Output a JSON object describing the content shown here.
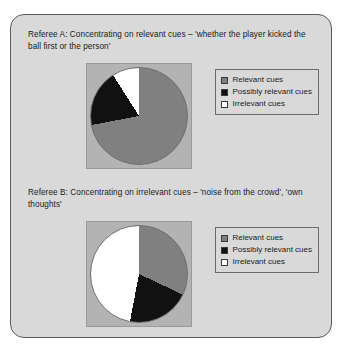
{
  "figure": {
    "background_color": "#d9d9d9",
    "border_color": "#5b5b5b"
  },
  "panels": [
    {
      "id": "referee-a",
      "title": "Referee A: Concentrating on relevant cues – 'whether the player kicked the ball first or the person'"
    },
    {
      "id": "referee-b",
      "title": "Referee B: Concentrating on irrelevant cues – 'noise from the crowd', 'own thoughts'"
    }
  ],
  "legend": {
    "items": [
      {
        "label": "Relevant cues",
        "color": "#808080",
        "swatch": "relevant-swatch"
      },
      {
        "label": "Possibly relevant cues",
        "color": "#111111",
        "swatch": "possibly-relevant-swatch"
      },
      {
        "label": "Irrelevant cues",
        "color": "#ffffff",
        "swatch": "irrelevant-swatch"
      }
    ]
  },
  "chart_data": [
    {
      "type": "pie",
      "id": "referee-a-pie",
      "title": "Referee A: Concentrating on relevant cues – 'whether the player kicked the ball first or the person'",
      "labels": [
        "Relevant cues",
        "Possibly relevant cues",
        "Irrelevant cues"
      ],
      "values": [
        72,
        19,
        9
      ],
      "colors": [
        "#808080",
        "#111111",
        "#ffffff"
      ],
      "start_angle_deg": 0,
      "direction": "clockwise",
      "legend_position": "right",
      "plot_background": "#b3b3b3"
    },
    {
      "type": "pie",
      "id": "referee-b-pie",
      "title": "Referee B: Concentrating on irrelevant cues – 'noise from the crowd', 'own thoughts'",
      "labels": [
        "Relevant cues",
        "Possibly relevant cues",
        "Irrelevant cues"
      ],
      "values": [
        32,
        21,
        47
      ],
      "colors": [
        "#808080",
        "#111111",
        "#ffffff"
      ],
      "start_angle_deg": 0,
      "direction": "clockwise",
      "legend_position": "right",
      "plot_background": "#b3b3b3"
    }
  ]
}
